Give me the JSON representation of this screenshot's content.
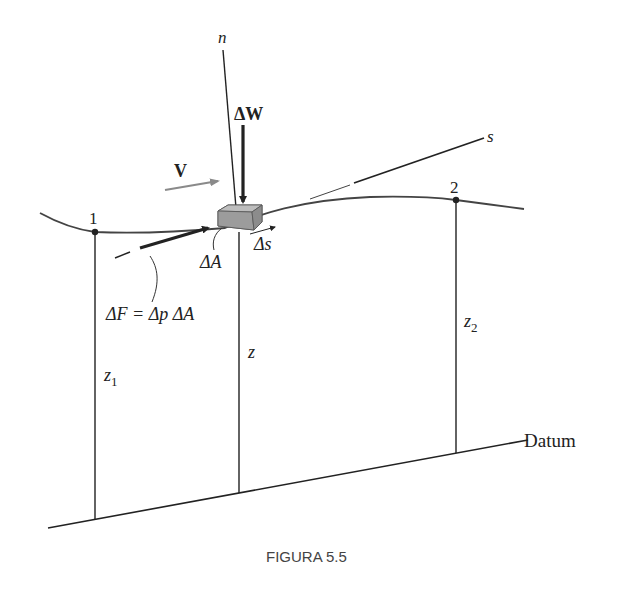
{
  "figure": {
    "caption": "FIGURA 5.5",
    "labels": {
      "normal_axis": "n",
      "streamline_axis": "s",
      "weight": "ΔW",
      "velocity": "V",
      "area": "ΔA",
      "length": "Δs",
      "force": "ΔF = Δp ΔA",
      "point_1": "1",
      "point_2": "2",
      "height_1": "z",
      "height_1_sub": "1",
      "height": "z",
      "height_2": "z",
      "height_2_sub": "2",
      "datum": "Datum"
    },
    "colors": {
      "line": "#222222",
      "block_top": "#b8b8b8",
      "block_front": "#9a9a9a",
      "block_side": "#8a8a8a",
      "velocity_arrow": "#8a8a8a",
      "caption": "#444444"
    }
  }
}
